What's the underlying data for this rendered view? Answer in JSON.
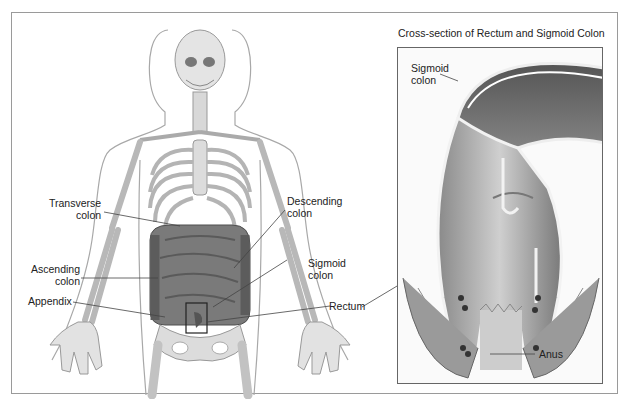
{
  "figure": {
    "title": "Cross-section of Rectum and Sigmoid Colon",
    "body_labels": [
      {
        "id": "transverse",
        "lines": [
          "Transverse",
          "colon"
        ]
      },
      {
        "id": "ascending",
        "lines": [
          "Ascending",
          "colon"
        ]
      },
      {
        "id": "appendix",
        "lines": [
          "Appendix"
        ]
      },
      {
        "id": "descending",
        "lines": [
          "Descending",
          "colon"
        ]
      },
      {
        "id": "sigmoid",
        "lines": [
          "Sigmoid",
          "colon"
        ]
      },
      {
        "id": "rectum",
        "lines": [
          "Rectum"
        ]
      }
    ],
    "inset_labels": [
      {
        "id": "inset-sigmoid",
        "lines": [
          "Sigmoid",
          "colon"
        ]
      },
      {
        "id": "anus",
        "lines": [
          "Anus"
        ]
      }
    ],
    "colors": {
      "bone": "#d8d8d8",
      "bone_outline": "#9c9c9c",
      "colon": "#6e6e6e",
      "colon_dark": "#4a4a4a",
      "frame": "#9a9a9a",
      "leader_line": "#444444"
    }
  }
}
